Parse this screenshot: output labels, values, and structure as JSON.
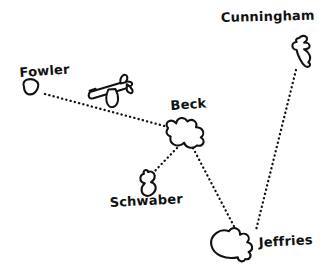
{
  "map": {
    "title": "Island Route Map",
    "background_color": "#ffffff",
    "ink_color": "#111111",
    "style": "hand-drawn sketch"
  },
  "islands": [
    {
      "id": "fowler",
      "label": "Fowler"
    },
    {
      "id": "cunningham",
      "label": "Cunningham"
    },
    {
      "id": "beck",
      "label": "Beck"
    },
    {
      "id": "schwaber",
      "label": "Schwaber"
    },
    {
      "id": "jeffries",
      "label": "Jeffries"
    }
  ],
  "routes": [
    {
      "id": "fowler-beck",
      "from": "Fowler",
      "to": "Beck"
    },
    {
      "id": "beck-schwaber",
      "from": "Beck",
      "to": "Schwaber"
    },
    {
      "id": "beck-jeffries",
      "from": "Beck",
      "to": "Jeffries"
    },
    {
      "id": "cunningham-jeffries",
      "from": "Cunningham",
      "to": "Jeffries"
    }
  ],
  "icons": [
    {
      "id": "airplane",
      "name": "airplane-icon",
      "on_route": "fowler-beck"
    }
  ]
}
